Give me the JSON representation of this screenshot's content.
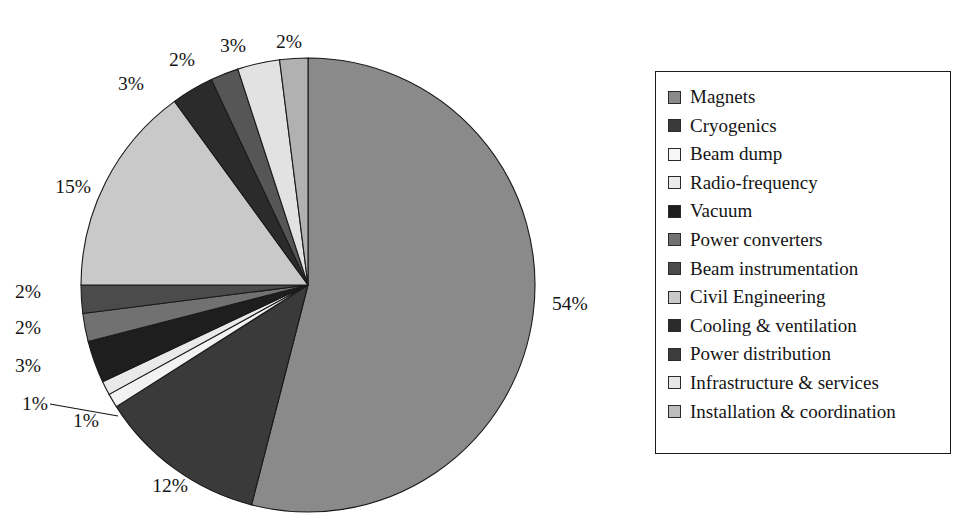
{
  "chart_data": {
    "type": "pie",
    "title": "",
    "start_angle_deg": 0,
    "direction": "clockwise",
    "legend_position": "right",
    "grid": false,
    "units": "%",
    "categories": [
      "Magnets",
      "Cryogenics",
      "Beam dump",
      "Radio-frequency",
      "Vacuum",
      "Power converters",
      "Beam instrumentation",
      "Civil Engineering",
      "Cooling & ventilation",
      "Power distribution",
      "Infrastructure & services",
      "Installation & coordination"
    ],
    "values": [
      54,
      12,
      1,
      1,
      3,
      2,
      2,
      15,
      3,
      2,
      3,
      2
    ],
    "labels": [
      "54%",
      "12%",
      "1%",
      "1%",
      "3%",
      "2%",
      "2%",
      "15%",
      "3%",
      "2%",
      "3%",
      "2%"
    ],
    "colors": [
      "#8a8a8a",
      "#3a3a3a",
      "#f2f2f2",
      "#e9e9e9",
      "#1e1e1e",
      "#717171",
      "#4b4b4b",
      "#c9c9c9",
      "#2b2b2b",
      "#565656",
      "#e2e2e2",
      "#b1b1b1"
    ],
    "slices": [
      {
        "name": "Magnets",
        "value": 54,
        "label": "54%",
        "color": "#8a8a8a"
      },
      {
        "name": "Cryogenics",
        "value": 12,
        "label": "12%",
        "color": "#3a3a3a"
      },
      {
        "name": "Beam dump",
        "value": 1,
        "label": "1%",
        "color": "#f2f2f2"
      },
      {
        "name": "Radio-frequency",
        "value": 1,
        "label": "1%",
        "color": "#e9e9e9"
      },
      {
        "name": "Vacuum",
        "value": 3,
        "label": "3%",
        "color": "#1e1e1e"
      },
      {
        "name": "Power converters",
        "value": 2,
        "label": "2%",
        "color": "#717171"
      },
      {
        "name": "Beam instrumentation",
        "value": 2,
        "label": "2%",
        "color": "#4b4b4b"
      },
      {
        "name": "Civil Engineering",
        "value": 15,
        "label": "15%",
        "color": "#c9c9c9"
      },
      {
        "name": "Cooling & ventilation",
        "value": 3,
        "label": "3%",
        "color": "#2b2b2b"
      },
      {
        "name": "Power distribution",
        "value": 2,
        "label": "2%",
        "color": "#565656"
      },
      {
        "name": "Infrastructure & services",
        "value": 3,
        "label": "3%",
        "color": "#e2e2e2"
      },
      {
        "name": "Installation & coordination",
        "value": 2,
        "label": "2%",
        "color": "#b1b1b1"
      }
    ]
  },
  "pie": {
    "center_x": 308,
    "center_y": 285,
    "radius": 227,
    "percent_labels": [
      {
        "text": "54%",
        "x": 552,
        "y": 310,
        "anchor": "start"
      },
      {
        "text": "12%",
        "x": 170,
        "y": 492,
        "anchor": "middle"
      },
      {
        "text": "1%",
        "x": 86,
        "y": 427,
        "anchor": "middle"
      },
      {
        "text": "1%",
        "x": 35,
        "y": 410,
        "anchor": "middle"
      },
      {
        "text": "3%",
        "x": 28,
        "y": 372,
        "anchor": "middle"
      },
      {
        "text": "2%",
        "x": 28,
        "y": 334,
        "anchor": "middle"
      },
      {
        "text": "2%",
        "x": 28,
        "y": 298,
        "anchor": "middle"
      },
      {
        "text": "15%",
        "x": 73,
        "y": 193,
        "anchor": "middle"
      },
      {
        "text": "3%",
        "x": 131,
        "y": 90,
        "anchor": "middle"
      },
      {
        "text": "2%",
        "x": 182,
        "y": 66,
        "anchor": "middle"
      },
      {
        "text": "3%",
        "x": 233,
        "y": 52,
        "anchor": "middle"
      },
      {
        "text": "2%",
        "x": 289,
        "y": 48,
        "anchor": "middle"
      }
    ]
  },
  "legend": {
    "items": [
      {
        "label": "Magnets",
        "color": "#8a8a8a"
      },
      {
        "label": "Cryogenics",
        "color": "#3a3a3a"
      },
      {
        "label": "Beam dump",
        "color": "#f6f6f6"
      },
      {
        "label": "Radio-frequency",
        "color": "#ebebeb"
      },
      {
        "label": "Vacuum",
        "color": "#1e1e1e"
      },
      {
        "label": "Power converters",
        "color": "#717171"
      },
      {
        "label": "Beam instrumentation",
        "color": "#4b4b4b"
      },
      {
        "label": "Civil Engineering",
        "color": "#c9c9c9"
      },
      {
        "label": "Cooling & ventilation",
        "color": "#2b2b2b"
      },
      {
        "label": "Power distribution",
        "color": "#3d3d3d"
      },
      {
        "label": "Infrastructure & services",
        "color": "#e7e7e7"
      },
      {
        "label": "Installation & coordination",
        "color": "#bdbdbd"
      }
    ]
  }
}
